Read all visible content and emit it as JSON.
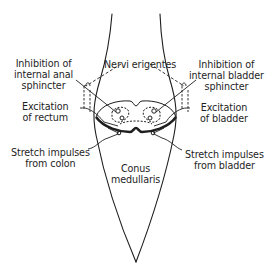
{
  "diagram": {
    "labels": {
      "nervi_erigentes": "Nervi erigentes",
      "inhibition_anal": [
        "Inhibition of",
        "internal anal",
        "sphincter"
      ],
      "excitation_rectum": [
        "Excitation",
        "of rectum"
      ],
      "inhibition_bladder": [
        "Inhibition of",
        "internal bladder",
        "sphincter"
      ],
      "excitation_bladder": [
        "Excitation",
        "of bladder"
      ],
      "stretch_colon": [
        "Stretch impulses",
        "from colon"
      ],
      "stretch_bladder": [
        "Stretch impulses",
        "from bladder"
      ],
      "conus": [
        "Conus",
        "medullaris"
      ]
    },
    "colors": {
      "ink": "#1e1e1e",
      "background": "#ffffff"
    }
  }
}
